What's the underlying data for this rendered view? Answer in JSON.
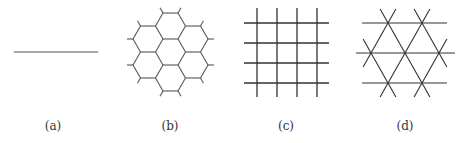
{
  "figure": {
    "panels": [
      {
        "id": "a",
        "label": "(a)",
        "lattice": "line",
        "description": "one-dimensional chain"
      },
      {
        "id": "b",
        "label": "(b)",
        "lattice": "honeycomb",
        "description": "hexagonal honeycomb with 7 hexagons and dangling bonds"
      },
      {
        "id": "c",
        "label": "(c)",
        "lattice": "square",
        "description": "square grid, 4 vertical and 4 horizontal lines"
      },
      {
        "id": "d",
        "label": "(d)",
        "lattice": "triangular",
        "description": "triangular lattice, 3 horizontal lines with diagonals"
      }
    ],
    "colors": {
      "line": "#555555",
      "grid": "#333333",
      "label": "#333333",
      "background": "#ffffff"
    }
  }
}
